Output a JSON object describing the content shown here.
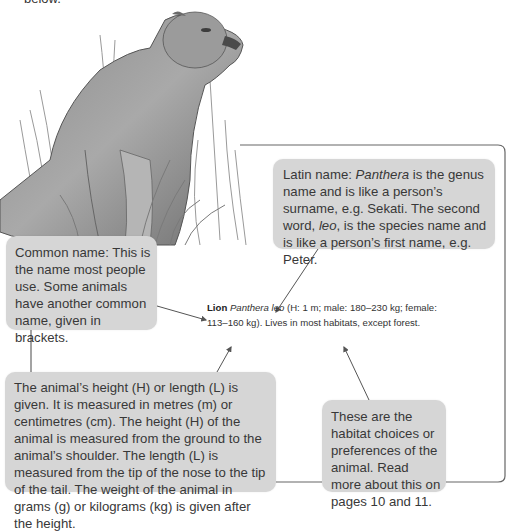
{
  "page": {
    "top_text": "below."
  },
  "illustration": {
    "subject": "lioness-sitting-in-grass"
  },
  "callouts": {
    "latin": {
      "prefix": "Latin name: ",
      "genus": "Panthera",
      "mid1": " is the genus name and is like a person’s surname, e.g. Sekati. The second word, ",
      "species": "leo",
      "mid2": ", is the species name and is like a person’s first name, e.g. Peter."
    },
    "common": {
      "text": "Common name: This is the name most people use. Some animals have another common name, given in brackets."
    },
    "measure": {
      "text": "The animal’s height (H) or length (L) is given. It is measured in metres (m) or centimetres (cm). The height (H) of the animal is measured from the ground to the animal’s shoulder. The length (L) is measured from the tip of the nose to the tip of the tail. The weight of the animal in grams (g) or kilograms (kg) is given after the height."
    },
    "habitat": {
      "text": "These are the habitat choices or preferences of the animal. Read more about this on pages 10 and 11."
    }
  },
  "entry": {
    "common_name": "Lion",
    "latin_name": "Panthera leo",
    "details_line1": " (H: 1 m; male: 180–230 kg; female:",
    "details_line2": "113–160 kg). Lives in most habitats, except forest."
  },
  "colors": {
    "callout_bg": "#d6d6d6",
    "line": "#555555",
    "text": "#383838"
  }
}
